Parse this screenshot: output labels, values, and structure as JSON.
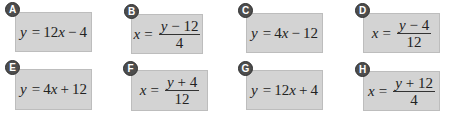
{
  "colors": {
    "card_fill": "#d3d3d3",
    "card_border": "#bdbdbd",
    "badge_fill": "#4d4d4d",
    "badge_text": "#ffffff",
    "text": "#222222"
  },
  "options": [
    {
      "letter": "A",
      "form": "linear",
      "lhs": "y",
      "equals": "=",
      "rhs_text": "12x − 4",
      "coef": "12",
      "var": "x",
      "op": "−",
      "const": "4"
    },
    {
      "letter": "B",
      "form": "fraction",
      "lhs": "x",
      "equals": "=",
      "numerator_var": "y",
      "numerator_rest": " − 12",
      "denominator": "4"
    },
    {
      "letter": "C",
      "form": "linear",
      "lhs": "y",
      "equals": "=",
      "rhs_text": "4x − 12",
      "coef": "4",
      "var": "x",
      "op": "−",
      "const": "12"
    },
    {
      "letter": "D",
      "form": "fraction",
      "lhs": "x",
      "equals": "=",
      "numerator_var": "y",
      "numerator_rest": " − 4",
      "denominator": "12"
    },
    {
      "letter": "E",
      "form": "linear",
      "lhs": "y",
      "equals": "=",
      "rhs_text": "4x + 12",
      "coef": "4",
      "var": "x",
      "op": "+",
      "const": "12"
    },
    {
      "letter": "F",
      "form": "fraction",
      "lhs": "x",
      "equals": "=",
      "numerator_var": "y",
      "numerator_rest": " + 4",
      "denominator": "12"
    },
    {
      "letter": "G",
      "form": "linear",
      "lhs": "y",
      "equals": "=",
      "rhs_text": "12x + 4",
      "coef": "12",
      "var": "x",
      "op": "+",
      "const": "4"
    },
    {
      "letter": "H",
      "form": "fraction",
      "lhs": "x",
      "equals": "=",
      "numerator_var": "y",
      "numerator_rest": " + 12",
      "denominator": "4"
    }
  ]
}
